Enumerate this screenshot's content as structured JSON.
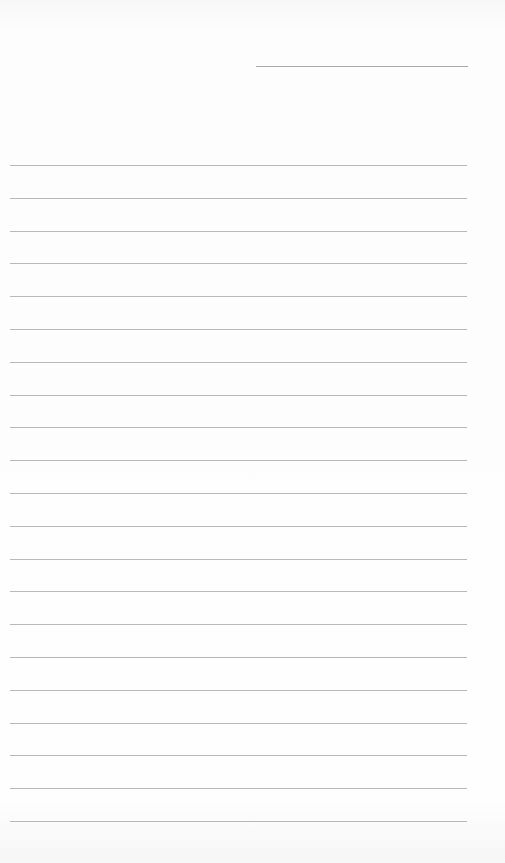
{
  "page": {
    "type": "lined-paper",
    "background_color": "#fdfdfd",
    "line_color": "#b8b8b8",
    "date_field": {
      "value": ""
    },
    "ruled_lines": {
      "count": 21,
      "first_y": 165,
      "spacing": 32.8,
      "values": [
        "",
        "",
        "",
        "",
        "",
        "",
        "",
        "",
        "",
        "",
        "",
        "",
        "",
        "",
        "",
        "",
        "",
        "",
        "",
        "",
        ""
      ]
    }
  }
}
